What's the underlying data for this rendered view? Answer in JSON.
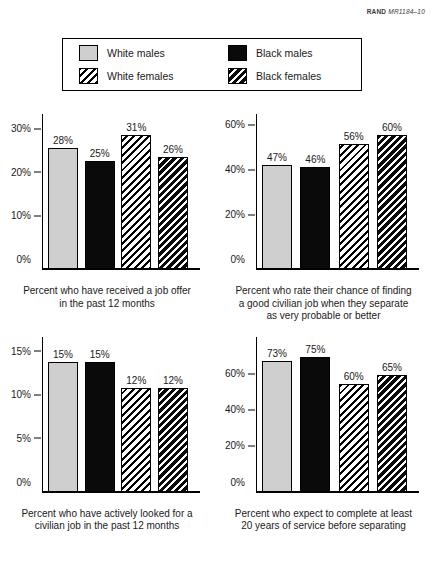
{
  "header": {
    "publisher": "RAND",
    "document_code": "MR1184–10"
  },
  "legend": {
    "items": [
      {
        "label": "White males",
        "pattern": "solid-light-gray",
        "color": "#cfcfcf"
      },
      {
        "label": "Black males",
        "pattern": "solid-black",
        "color": "#0a0a0a"
      },
      {
        "label": "White females",
        "pattern": "black-diagonal-hatch-on-white",
        "color": "#ffffff"
      },
      {
        "label": "Black females",
        "pattern": "white-diagonal-hatch-on-black",
        "color": "#0a0a0a"
      }
    ]
  },
  "chart_data": [
    {
      "type": "bar",
      "title": "",
      "caption_lines": [
        "Percent who have received a job offer",
        "in the past 12 months"
      ],
      "categories": [
        "White males",
        "Black males",
        "White females",
        "Black females"
      ],
      "values": [
        28,
        25,
        31,
        26
      ],
      "value_labels": [
        "28%",
        "25%",
        "31%",
        "26%"
      ],
      "ytick_labels": [
        "0%",
        "10%",
        "20%",
        "30%"
      ],
      "yticks": [
        0,
        10,
        20,
        30
      ],
      "ylim": [
        0,
        34
      ],
      "xlabel": "",
      "ylabel": "",
      "grid": false,
      "legend_position": "top-shared"
    },
    {
      "type": "bar",
      "title": "",
      "caption_lines": [
        "Percent who rate their chance of finding",
        "a good civilian job when they separate",
        "as very probable or better"
      ],
      "categories": [
        "White males",
        "Black males",
        "White females",
        "Black females"
      ],
      "values": [
        47,
        46,
        56,
        60
      ],
      "value_labels": [
        "47%",
        "46%",
        "56%",
        "60%"
      ],
      "ytick_labels": [
        "0%",
        "20%",
        "40%",
        "60%"
      ],
      "yticks": [
        0,
        20,
        40,
        60
      ],
      "ylim": [
        0,
        66
      ],
      "xlabel": "",
      "ylabel": "",
      "grid": false,
      "legend_position": "top-shared"
    },
    {
      "type": "bar",
      "title": "",
      "caption_lines": [
        "Percent who have actively looked for a",
        "civilian job in the past 12 months"
      ],
      "categories": [
        "White males",
        "Black males",
        "White females",
        "Black females"
      ],
      "values": [
        15,
        15,
        12,
        12
      ],
      "value_labels": [
        "15%",
        "15%",
        "12%",
        "12%"
      ],
      "ytick_labels": [
        "0%",
        "5%",
        "10%",
        "15%"
      ],
      "yticks": [
        0,
        5,
        10,
        15
      ],
      "ylim": [
        0,
        17
      ],
      "xlabel": "",
      "ylabel": "",
      "grid": false,
      "legend_position": "top-shared"
    },
    {
      "type": "bar",
      "title": "",
      "caption_lines": [
        "Percent who expect to complete at least",
        "20 years of service before separating"
      ],
      "categories": [
        "White males",
        "Black males",
        "White females",
        "Black females"
      ],
      "values": [
        73,
        75,
        60,
        65
      ],
      "value_labels": [
        "73%",
        "75%",
        "60%",
        "65%"
      ],
      "ytick_labels": [
        "0%",
        "20%",
        "40%",
        "60%"
      ],
      "yticks": [
        0,
        20,
        40,
        60
      ],
      "ylim": [
        0,
        82
      ],
      "xlabel": "",
      "ylabel": "",
      "grid": false,
      "legend_position": "top-shared"
    }
  ]
}
